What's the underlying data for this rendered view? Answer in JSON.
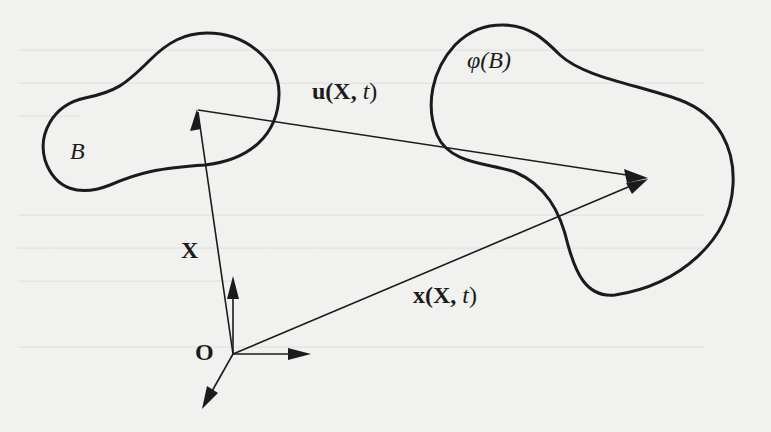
{
  "diagram": {
    "bodies": {
      "reference": {
        "label": "B"
      },
      "current": {
        "label_func": "φ",
        "label_arg": "(B)"
      }
    },
    "vectors": {
      "position_reference": {
        "label": "X"
      },
      "displacement": {
        "label_u": "u",
        "label_args": "(X, ",
        "label_t": "t",
        "label_close": ")"
      },
      "position_current": {
        "label_x": "x",
        "label_args": "(X, ",
        "label_t": "t",
        "label_close": ")"
      }
    },
    "origin": {
      "label": "O"
    },
    "colors": {
      "ink": "#1b1b1b",
      "paper": "#f1f1ef"
    }
  }
}
